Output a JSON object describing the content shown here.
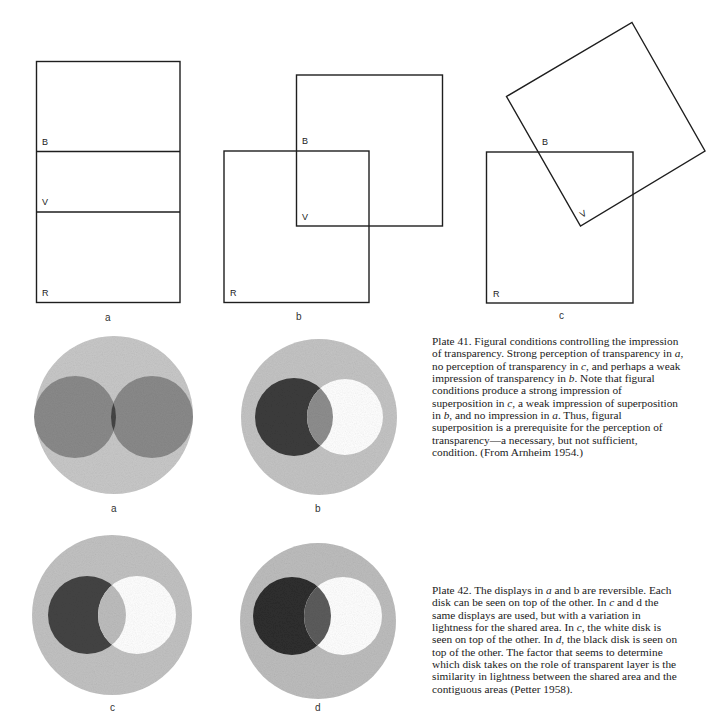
{
  "figures": {
    "squares": [
      {
        "caption": "a",
        "labels": {
          "B": "B",
          "V": "V",
          "R": "R"
        }
      },
      {
        "caption": "b",
        "labels": {
          "B": "B",
          "V": "V",
          "R": "R"
        }
      },
      {
        "caption": "c",
        "labels": {
          "B": "B",
          "V": "V",
          "R": "R"
        }
      }
    ],
    "disks": [
      {
        "caption": "a",
        "inner_left_color": "#8a8a8a",
        "inner_right_color": "#8a8a8a",
        "overlap_color": "#454545"
      },
      {
        "caption": "b",
        "inner_left_color": "#3c3c3c",
        "inner_right_color": "#ffffff",
        "overlap_color": "#8e8e8e"
      },
      {
        "caption": "c",
        "inner_left_color": "#444444",
        "inner_right_color": "#ffffff",
        "overlap_color": "#bdbdbd"
      },
      {
        "caption": "d",
        "inner_left_color": "#2e2e2e",
        "inner_right_color": "#ffffff",
        "overlap_color": "#5c5c5c"
      }
    ],
    "ring_color": "#c4c4c4"
  },
  "plate41": {
    "lines": [
      "Plate 41. Figural conditions controlling the impression",
      "of transparency. Strong perception of transparency in a,",
      "no perception of transparency in c, and perhaps a weak",
      "impression of transparency in b. Note that figural",
      "conditions produce a strong impression of",
      "superposition in c, a weak impression of superposition",
      "in b, and no impression in a. Thus, figural",
      "superposition is a prerequisite for the perception of",
      "transparency—a necessary, but not sufficient,",
      "condition. (From Arnheim 1954.)"
    ]
  },
  "plate42": {
    "lines": [
      "Plate 42. The displays in a and b are reversible. Each",
      "disk can be seen on top of the other. In c and d the",
      "same displays are used, but with a variation in",
      "lightness for the shared area. In c, the white disk is",
      "seen on top of the other. In d, the black disk is seen on",
      "top of the other. The factor that seems to determine",
      "which disk takes on the role of transparent layer is the",
      "similarity in lightness between the shared area and the",
      "contiguous areas (Petter 1958)."
    ]
  }
}
